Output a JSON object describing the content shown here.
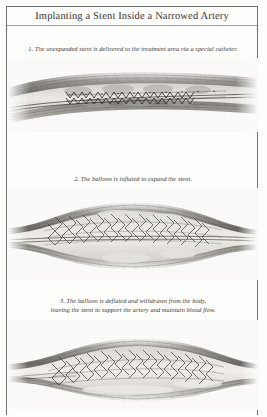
{
  "document": {
    "title": "Implanting a Stent Inside a Narrowed Artery",
    "page_background": "#fdfdfc",
    "ink_color": "#2b2b2b",
    "frame_color": "#6f6f6f",
    "style": "grayscale engraved medical illustration, scanned page"
  },
  "steps": [
    {
      "number": "1.",
      "caption": "The unexpanded stent is delivered to the treatment area via a special catheter.",
      "caption_full": "1.  The unexpanded stent is delivered to the treatment area via a special catheter.",
      "figure_name": "artery-with-unexpanded-stent",
      "figure_description": "Longitudinal cutaway of a narrowed artery with a collapsed stent crimped on a catheter inside the vessel lumen.",
      "lines": 1
    },
    {
      "number": "2.",
      "caption": "The balloon is inflated to expand the stent.",
      "caption_full": "2.  The balloon is inflated to expand the stent.",
      "figure_name": "artery-with-inflated-balloon",
      "figure_description": "The artery bulges outward as the balloon inflates and the diamond-mesh stent expands against the vessel wall.",
      "lines": 1
    },
    {
      "number": "3.",
      "caption_line_1": "The balloon is deflated and withdrawn from the body,",
      "caption_line_2": "leaving the stent to support the artery and maintain blood flow.",
      "caption_full": "3.  The balloon is deflated and withdrawn from the body, leaving the stent to support the artery and maintain blood flow.",
      "figure_name": "artery-with-deployed-stent",
      "figure_description": "The expanded diamond-mesh stent remains in place holding the artery open after the balloon and catheter are removed.",
      "lines": 2
    }
  ]
}
